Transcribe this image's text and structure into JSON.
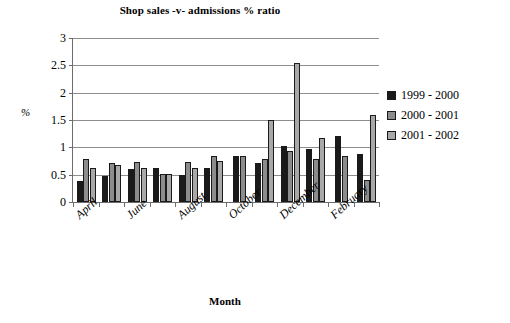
{
  "chart_data": {
    "type": "bar",
    "title": "Shop sales -v- admissions % ratio",
    "xlabel": "Month",
    "ylabel": "%",
    "ylim": [
      0,
      3
    ],
    "ytick_values": [
      0,
      0.5,
      1,
      1.5,
      2,
      2.5,
      3
    ],
    "ytick_labels": [
      "0",
      "0.5",
      "1",
      "1.5",
      "2",
      "2.5",
      "3"
    ],
    "grid": true,
    "legend_position": "right",
    "categories": [
      "April",
      "May",
      "June",
      "July",
      "August",
      "September",
      "October",
      "November",
      "December",
      "January",
      "February",
      "March"
    ],
    "visible_tick_labels": [
      "April",
      "",
      "June",
      "",
      "August",
      "",
      "October",
      "",
      "December",
      "",
      "February",
      ""
    ],
    "series": [
      {
        "name": "1999 - 2000",
        "color": "#1a1a1a",
        "values": [
          0.38,
          0.48,
          0.6,
          0.62,
          0.5,
          0.62,
          0.85,
          0.72,
          1.03,
          0.97,
          1.2,
          0.88
        ]
      },
      {
        "name": "2000 - 2001",
        "color": "#8c8c8c",
        "values": [
          0.78,
          0.72,
          0.73,
          0.52,
          0.73,
          0.85,
          0.85,
          0.78,
          0.93,
          0.78,
          0.85,
          0.4
        ]
      },
      {
        "name": "2001 - 2002",
        "color": "#a8a8a8",
        "values": [
          0.62,
          0.67,
          0.62,
          0.52,
          0.62,
          0.75,
          null,
          1.5,
          2.55,
          1.18,
          null,
          1.6
        ]
      }
    ]
  }
}
